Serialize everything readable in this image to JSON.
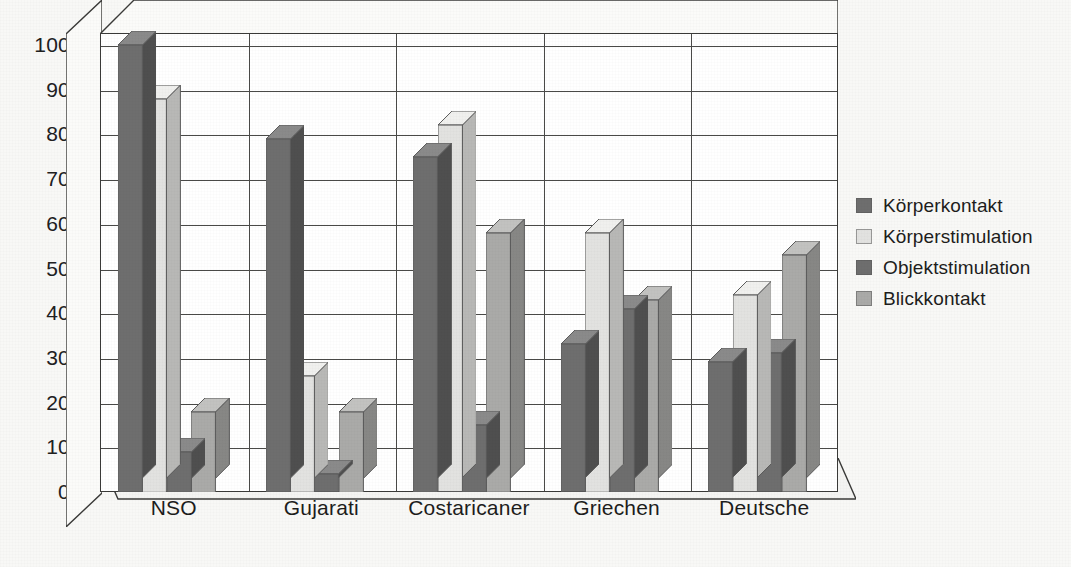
{
  "chart_data": {
    "type": "bar",
    "title": "",
    "subtitle": "",
    "xlabel": "",
    "ylabel": "",
    "ylim": [
      0,
      100
    ],
    "ytick_step": 10,
    "yticks": [
      100,
      90,
      80,
      70,
      60,
      50,
      40,
      30,
      20,
      10,
      0
    ],
    "grid": true,
    "grid_orientation": "horizontal",
    "legend_position": "right",
    "style": "3d-bar",
    "categories": [
      "NSO",
      "Gujarati",
      "Costaricaner",
      "Griechen",
      "Deutsche"
    ],
    "series": [
      {
        "name": "Körperkontakt",
        "color": "#6e6e6e",
        "side_color": "#4f4f4f",
        "top_color": "#8a8a8a",
        "values": [
          100,
          79,
          75,
          33,
          29
        ]
      },
      {
        "name": "Körperstimulation",
        "color": "#e2e2e0",
        "side_color": "#b8b8b6",
        "top_color": "#f0f0ee",
        "values": [
          88,
          26,
          82,
          58,
          44
        ]
      },
      {
        "name": "Objektstimulation",
        "color": "#6e6e6e",
        "side_color": "#4f4f4f",
        "top_color": "#8a8a8a",
        "values": [
          9,
          4,
          15,
          41,
          31
        ]
      },
      {
        "name": "Blickkontakt",
        "color": "#aaaaa8",
        "side_color": "#87878 5",
        "top_color": "#c2c2c0",
        "values": [
          18,
          18,
          58,
          43,
          53
        ]
      }
    ],
    "legend": [
      "Körperkontakt",
      "Körperstimulation",
      "Objektstimulation",
      "Blickkontakt"
    ]
  },
  "colors": {
    "background": "#f8f8f6",
    "plot_background": "#ffffff",
    "axis_line": "#3a3a38",
    "grid_line": "#4a4a48",
    "text": "#1d1d1c",
    "wall_fill": "#fbfbf9",
    "floor_fill": "#f4f4f2"
  }
}
